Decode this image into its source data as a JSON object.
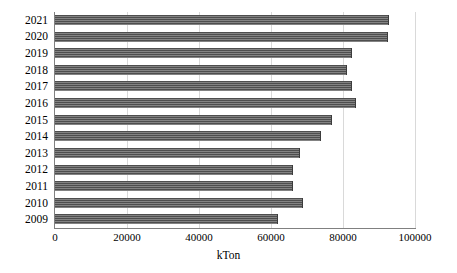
{
  "chart_data": {
    "type": "bar",
    "orientation": "horizontal",
    "title": "",
    "subtitle": "",
    "xlabel": "kTon",
    "ylabel": "",
    "categories": [
      "2009",
      "2010",
      "2011",
      "2012",
      "2013",
      "2014",
      "2015",
      "2016",
      "2017",
      "2018",
      "2019",
      "2020",
      "2021"
    ],
    "values": [
      62000,
      69000,
      66000,
      66000,
      68000,
      74000,
      77000,
      83500,
      82500,
      81000,
      82500,
      92500,
      92700
    ],
    "xlim": [
      0,
      100000
    ],
    "xticks": [
      0,
      20000,
      40000,
      60000,
      80000,
      100000
    ],
    "xtick_labels": [
      "0",
      "20000",
      "40000",
      "60000",
      "80000",
      "100000"
    ],
    "grid": "vertical",
    "legend": "none",
    "series": [
      {
        "name": "kTon",
        "color": "#4e4e4e",
        "pattern": "horizontal-hatch",
        "values": [
          62000,
          69000,
          66000,
          66000,
          68000,
          74000,
          77000,
          83500,
          82500,
          81000,
          82500,
          92500,
          92700
        ]
      }
    ]
  },
  "axes": {
    "x_title": "kTon",
    "x_tick_labels": [
      "0",
      "20000",
      "40000",
      "60000",
      "80000",
      "100000"
    ],
    "y_tick_labels": [
      "2021",
      "2020",
      "2019",
      "2018",
      "2017",
      "2016",
      "2015",
      "2014",
      "2013",
      "2012",
      "2011",
      "2010",
      "2009"
    ]
  },
  "colors": {
    "bar": "#4e4e4e",
    "gridline": "#d9d9d9",
    "axis": "#808080",
    "text": "#000000",
    "background": "#ffffff"
  }
}
